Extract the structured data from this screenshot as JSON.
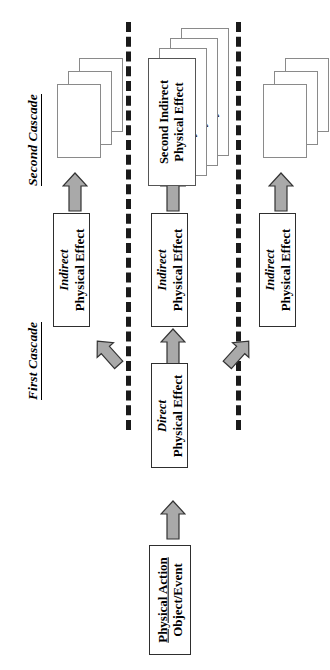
{
  "diagram": {
    "orientation": "rotated-90-ccw",
    "colors": {
      "arrow_fill": "#a9a9a9",
      "arrow_stroke": "#333333",
      "box_stroke": "#2e2e2e",
      "card_stroke": "#8a8a8a",
      "divider": "#1a1a1a",
      "background": "#ffffff"
    },
    "section_labels": {
      "second_cascade": "Second Cascade",
      "first_cascade": "First Cascade"
    },
    "root_box": {
      "line1": "Physical Action",
      "line2": "Object/Event"
    },
    "direct_box": {
      "line1": "Direct",
      "line2": "Physical Effect"
    },
    "first_cascade_boxes": [
      {
        "line1": "Indirect",
        "line2": "Physical Effect"
      },
      {
        "line1": "Indirect",
        "line2": "Physical Effect"
      },
      {
        "line1": "Indirect",
        "line2": "Physical Effect"
      }
    ],
    "second_cascade_stacks": [
      {
        "cards": [
          "",
          "",
          ""
        ]
      },
      {
        "cards": [
          "Second Indirect|Physical Effect",
          "Second Indirect|Physical Effect",
          "Second Indirect|Physical Effect",
          "Second Indirect|Physical Effect"
        ]
      },
      {
        "cards": [
          "",
          "",
          ""
        ]
      }
    ],
    "middle_stack_front_card": {
      "line1": "Second Indirect",
      "line2": "Physical Effect"
    },
    "arrows": {
      "up_label": "arrow-up",
      "diag_left_label": "arrow-up-left",
      "diag_right_label": "arrow-up-right",
      "count_up": 5,
      "count_diagonal": 2
    },
    "dividers": {
      "count": 2,
      "style": "dashed-vertical"
    }
  }
}
